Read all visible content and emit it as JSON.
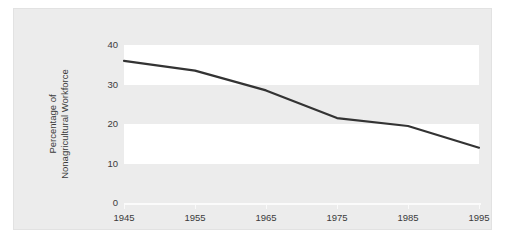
{
  "chart_data": {
    "type": "line",
    "title": "",
    "subtitle": "",
    "xlabel": "",
    "ylabel": "Percentage of\nNonagricultural Workforce",
    "ylabel_lines": [
      "Percentage of",
      "Nonagricultural Workforce"
    ],
    "categories": [
      "1945",
      "1955",
      "1965",
      "1975",
      "1985",
      "1995"
    ],
    "x": [
      1945,
      1955,
      1965,
      1975,
      1985,
      1995
    ],
    "xtick_labels": [
      "1945",
      "1955",
      "1965",
      "1975",
      "1985",
      "1995"
    ],
    "ytick_labels": [
      "0",
      "10",
      "20",
      "30",
      "40"
    ],
    "yticks": [
      0,
      10,
      20,
      30,
      40
    ],
    "xlim": [
      1945,
      1995
    ],
    "ylim": [
      0,
      40
    ],
    "grid": false,
    "legend": false,
    "legend_position": "none",
    "series": [
      {
        "name": "Percentage of Nonagricultural Workforce",
        "values": [
          36,
          33.5,
          28.5,
          21.5,
          19.5,
          14
        ],
        "color": "#333333"
      }
    ],
    "annotations": [],
    "banding": {
      "description": "alternating white horizontal bands behind plot",
      "bands": [
        [
          30,
          40
        ],
        [
          10,
          20
        ]
      ],
      "band_color": "#ffffff",
      "panel_color": "#ececec"
    }
  },
  "figure": {
    "background_color": "#ffffff",
    "panel_color": "#ececec",
    "border_color": "#e2e2e2",
    "line_color": "#333333",
    "text_color": "#3b3b3b",
    "axis_color": "#fbfbfb"
  }
}
